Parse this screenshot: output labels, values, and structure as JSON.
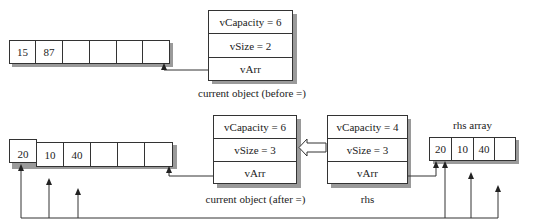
{
  "before": {
    "array": {
      "cells": [
        "15",
        "87",
        "",
        "",
        "",
        ""
      ]
    },
    "object": {
      "rows": [
        "vCapacity = 6",
        "vSize = 2",
        "vArr"
      ],
      "caption": "current object (before =)"
    }
  },
  "after": {
    "array": {
      "cells": [
        "20",
        "10",
        "40",
        "",
        "",
        ""
      ]
    },
    "object": {
      "rows": [
        "vCapacity = 6",
        "vSize = 3",
        "vArr"
      ],
      "caption": "current object (after =)"
    }
  },
  "rhs": {
    "object": {
      "rows": [
        "vCapacity = 4",
        "vSize = 3",
        "vArr"
      ],
      "caption": "rhs"
    },
    "array": {
      "label": "rhs array",
      "cells": [
        "20",
        "10",
        "40",
        ""
      ]
    }
  },
  "colors": {
    "line": "#333333",
    "shadow": "#9a9a9a",
    "background": "#ffffff"
  }
}
